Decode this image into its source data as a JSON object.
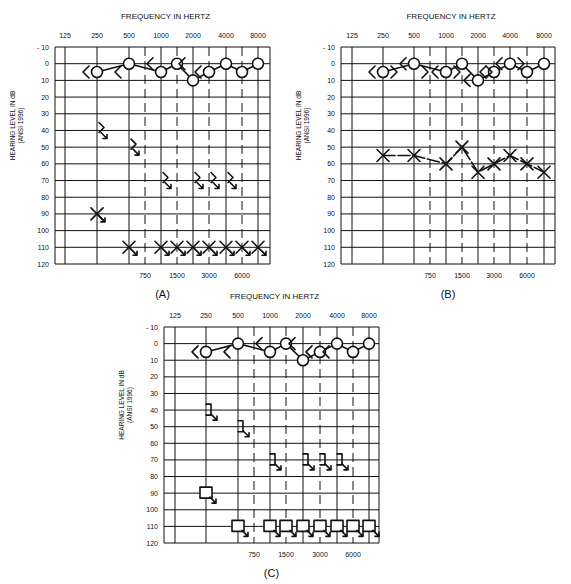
{
  "chart_data": [
    {
      "type": "scatter",
      "panel_label": "(A)",
      "title": "FREQUENCY IN HERTZ",
      "ylabel": "HEARING LEVEL IN dB",
      "ylabel_sub": "(ANSI 1996)",
      "x_top_ticks": [
        "125",
        "250",
        "500",
        "1000",
        "2000",
        "4000",
        "8000"
      ],
      "x_bottom_ticks": [
        "750",
        "1500",
        "3000",
        "6000"
      ],
      "y_ticks": [
        "- 10",
        "0",
        "10",
        "20",
        "30",
        "40",
        "50",
        "60",
        "70",
        "80",
        "90",
        "100",
        "110",
        "120"
      ],
      "ylim": [
        -10,
        120
      ],
      "grid": true,
      "series": [
        {
          "name": "Right ear air conduction (O)",
          "symbol": "O",
          "connected": true,
          "x": [
            250,
            500,
            1000,
            1500,
            2000,
            3000,
            4000,
            6000,
            8000
          ],
          "values": [
            5,
            0,
            5,
            0,
            10,
            5,
            0,
            5,
            0
          ]
        },
        {
          "name": "Right ear bone conduction (<)",
          "symbol": "<",
          "x": [
            250,
            500,
            1000,
            2000,
            3000
          ],
          "values": [
            5,
            5,
            0,
            0,
            5
          ]
        },
        {
          "name": "Left ear bone conduction no response",
          "symbol": "> with arrow",
          "x": [
            250,
            500,
            1000,
            2000,
            3000,
            4000
          ],
          "values": [
            40,
            50,
            70,
            70,
            70,
            70
          ]
        },
        {
          "name": "Left ear air conduction no response (X)",
          "symbol": "X with arrow",
          "x": [
            250,
            500,
            1000,
            1500,
            2000,
            3000,
            4000,
            6000,
            8000
          ],
          "values": [
            90,
            110,
            110,
            110,
            110,
            110,
            110,
            110,
            110
          ]
        }
      ]
    },
    {
      "type": "line",
      "panel_label": "(B)",
      "title": "FREQUENCY IN HERTZ",
      "ylabel": "HEARING LEVEL IN dB",
      "ylabel_sub": "(ANSI 1996)",
      "x_top_ticks": [
        "125",
        "250",
        "500",
        "1000",
        "2000",
        "4000",
        "8000"
      ],
      "x_bottom_ticks": [
        "750",
        "1500",
        "3000",
        "6000"
      ],
      "y_ticks": [
        "- 10",
        "0",
        "10",
        "20",
        "30",
        "40",
        "50",
        "60",
        "70",
        "80",
        "90",
        "100",
        "110",
        "120"
      ],
      "ylim": [
        -10,
        120
      ],
      "grid": true,
      "series": [
        {
          "name": "Right ear air conduction (O)",
          "symbol": "O",
          "connected": true,
          "x": [
            250,
            500,
            1000,
            1500,
            2000,
            3000,
            4000,
            6000,
            8000
          ],
          "values": [
            5,
            0,
            5,
            0,
            10,
            5,
            0,
            5,
            0
          ]
        },
        {
          "name": "Right ear bone conduction (<)",
          "symbol": "<",
          "x": [
            250,
            500,
            1000,
            2000,
            3000,
            4000
          ],
          "values": [
            5,
            0,
            5,
            10,
            5,
            0
          ]
        },
        {
          "name": "Left ear bone conduction (>)",
          "symbol": ">",
          "x": [
            250,
            500,
            1000,
            2000,
            4000
          ],
          "values": [
            5,
            5,
            5,
            5,
            0
          ]
        },
        {
          "name": "Left ear air conduction (X)",
          "symbol": "X",
          "connected": true,
          "x": [
            250,
            500,
            1000,
            1500,
            2000,
            3000,
            4000,
            6000,
            8000
          ],
          "values": [
            55,
            55,
            60,
            50,
            65,
            60,
            55,
            60,
            65
          ]
        }
      ]
    },
    {
      "type": "scatter",
      "panel_label": "(C)",
      "title": "FREQUENCY IN HERTZ",
      "ylabel": "HEARING LEVEL IN dB",
      "ylabel_sub": "(ANSI 1996)",
      "x_top_ticks": [
        "125",
        "250",
        "500",
        "1000",
        "2000",
        "4000",
        "8000"
      ],
      "x_bottom_ticks": [
        "750",
        "1500",
        "3000",
        "6000"
      ],
      "y_ticks": [
        "- 10",
        "0",
        "10",
        "20",
        "30",
        "40",
        "50",
        "60",
        "70",
        "80",
        "90",
        "100",
        "110",
        "120"
      ],
      "ylim": [
        -10,
        120
      ],
      "grid": true,
      "series": [
        {
          "name": "Right ear air conduction (O)",
          "symbol": "O",
          "connected": true,
          "x": [
            250,
            500,
            1000,
            1500,
            2000,
            3000,
            4000,
            6000,
            8000
          ],
          "values": [
            5,
            0,
            5,
            0,
            10,
            5,
            0,
            5,
            0
          ]
        },
        {
          "name": "Right ear bone conduction (<)",
          "symbol": "<",
          "x": [
            250,
            500,
            1000,
            2000,
            3000,
            4000
          ],
          "values": [
            5,
            5,
            0,
            0,
            5,
            5
          ]
        },
        {
          "name": "Left ear masked bone conduction no response (])",
          "symbol": "] with arrow",
          "x": [
            250,
            500,
            1000,
            2000,
            3000,
            4000
          ],
          "values": [
            40,
            50,
            70,
            70,
            70,
            70
          ]
        },
        {
          "name": "Left ear masked air conduction no response (square)",
          "symbol": "square with arrow",
          "x": [
            250,
            500,
            1000,
            1500,
            2000,
            3000,
            4000,
            6000,
            8000
          ],
          "values": [
            90,
            110,
            110,
            110,
            110,
            110,
            110,
            110,
            110
          ]
        }
      ]
    }
  ]
}
